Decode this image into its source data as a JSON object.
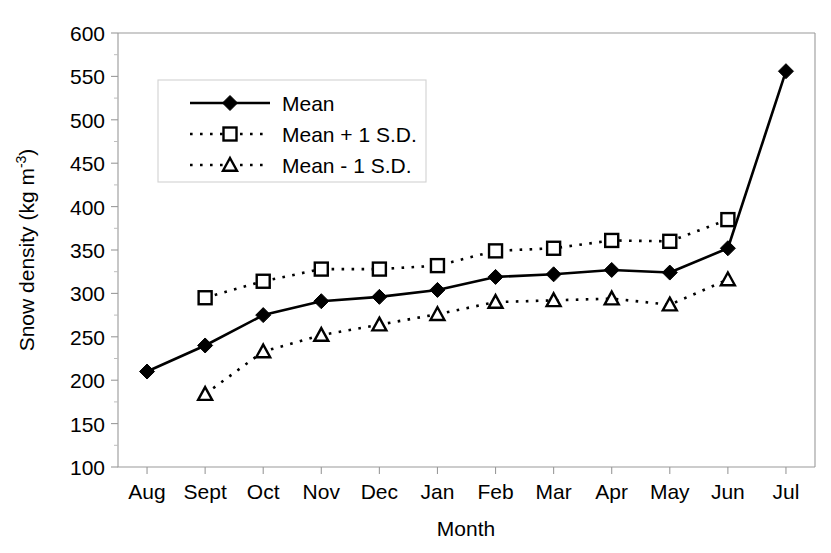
{
  "chart_data": {
    "type": "line",
    "title": "",
    "xlabel": "Month",
    "ylabel": "Snow density (kg m-3)",
    "ylabel_base": "Snow density (kg m",
    "ylabel_sup": "-3",
    "ylabel_tail": ")",
    "categories": [
      "Aug",
      "Sept",
      "Oct",
      "Nov",
      "Dec",
      "Jan",
      "Feb",
      "Mar",
      "Apr",
      "May",
      "Jun",
      "Jul"
    ],
    "ylim": [
      100,
      600
    ],
    "ytick_step": 50,
    "yticks": [
      100,
      150,
      200,
      250,
      300,
      350,
      400,
      450,
      500,
      550,
      600
    ],
    "ytick_labels": [
      "100",
      "150",
      "200",
      "250",
      "300",
      "350",
      "400",
      "450",
      "500",
      "550",
      "600"
    ],
    "grid": false,
    "legend_position": "upper-left-inside",
    "series": [
      {
        "name": "Mean",
        "marker": "diamond",
        "linestyle": "solid",
        "values": [
          210,
          240,
          275,
          291,
          296,
          304,
          319,
          322,
          327,
          324,
          352,
          556
        ]
      },
      {
        "name": "Mean + 1 S.D.",
        "marker": "square",
        "linestyle": "dotted",
        "values": [
          null,
          295,
          314,
          328,
          328,
          332,
          349,
          352,
          361,
          360,
          385,
          null
        ]
      },
      {
        "name": "Mean - 1 S.D.",
        "marker": "triangle",
        "linestyle": "dotted",
        "values": [
          null,
          184,
          233,
          252,
          264,
          276,
          290,
          292,
          294,
          287,
          316,
          null
        ]
      }
    ]
  },
  "legend": {
    "entries": [
      {
        "label": "Mean"
      },
      {
        "label": "Mean + 1 S.D."
      },
      {
        "label": "Mean - 1 S.D."
      }
    ]
  },
  "colors": {
    "line": "#000000",
    "axis": "#9a9a9a",
    "background": "#ffffff",
    "legend_border": "#d2d2d2"
  }
}
